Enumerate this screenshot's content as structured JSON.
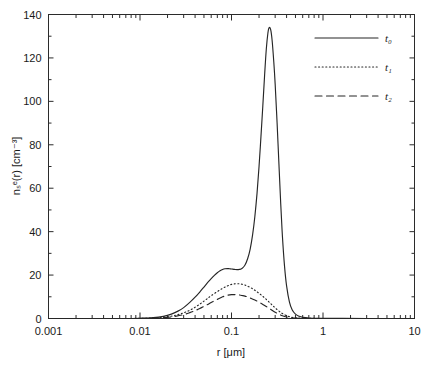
{
  "figure": {
    "background": "#ffffff",
    "line_color": "#262626"
  },
  "chart_data": {
    "type": "line",
    "title": "",
    "xlabel": "r [μm]",
    "ylabel": "nₛᵉ(r) [cm⁻³]",
    "xscale": "log",
    "yscale": "linear",
    "xlim": [
      0.001,
      10
    ],
    "ylim": [
      0,
      140
    ],
    "grid": false,
    "legend_position": "top-right",
    "xticks": [
      0.001,
      0.01,
      0.1,
      1,
      10
    ],
    "xtick_labels": [
      "0.001",
      "0.01",
      "0.1",
      "1",
      "10"
    ],
    "yticks": [
      0,
      20,
      40,
      60,
      80,
      100,
      120,
      140
    ],
    "ytick_labels": [
      "0",
      "20",
      "40",
      "60",
      "80",
      "100",
      "120",
      "140"
    ],
    "series": [
      {
        "name": "t₀",
        "style": "solid",
        "peak_value": 134,
        "peak_x": 0.25,
        "shoulder_value": 23,
        "shoulder_x": 0.085,
        "x": [
          0.001,
          0.003,
          0.006,
          0.01,
          0.014,
          0.018,
          0.022,
          0.026,
          0.03,
          0.035,
          0.04,
          0.045,
          0.05,
          0.055,
          0.06,
          0.065,
          0.07,
          0.075,
          0.08,
          0.085,
          0.09,
          0.095,
          0.1,
          0.108,
          0.115,
          0.122,
          0.13,
          0.14,
          0.15,
          0.16,
          0.17,
          0.18,
          0.19,
          0.2,
          0.21,
          0.22,
          0.23,
          0.24,
          0.25,
          0.258,
          0.268,
          0.278,
          0.29,
          0.3,
          0.315,
          0.33,
          0.345,
          0.36,
          0.38,
          0.4,
          0.43,
          0.46,
          0.5,
          0.55,
          0.6,
          0.7,
          0.9,
          1.5,
          3.0,
          10.0
        ],
        "y": [
          0.0,
          0.0,
          0.0,
          0.1,
          0.4,
          1.0,
          2.0,
          3.4,
          5.0,
          7.4,
          9.8,
          12.2,
          14.5,
          16.6,
          18.4,
          19.9,
          21.1,
          22.0,
          22.6,
          22.9,
          23.0,
          22.9,
          22.8,
          22.6,
          22.5,
          22.6,
          23.0,
          24.5,
          27.5,
          32.0,
          38.5,
          47.0,
          57.5,
          70.0,
          84.0,
          98.0,
          112.0,
          124.0,
          131.5,
          134.0,
          133.0,
          128.0,
          118.0,
          108.0,
          90.0,
          71.0,
          53.0,
          38.0,
          24.0,
          15.0,
          7.5,
          4.0,
          2.0,
          1.0,
          0.55,
          0.25,
          0.1,
          0.03,
          0.0,
          0.0
        ]
      },
      {
        "name": "t₁",
        "style": "dotted",
        "peak_value": 16,
        "peak_x": 0.11,
        "x": [
          0.001,
          0.005,
          0.01,
          0.015,
          0.02,
          0.025,
          0.03,
          0.035,
          0.04,
          0.045,
          0.05,
          0.055,
          0.06,
          0.07,
          0.08,
          0.09,
          0.1,
          0.11,
          0.12,
          0.13,
          0.14,
          0.15,
          0.165,
          0.18,
          0.2,
          0.22,
          0.24,
          0.26,
          0.28,
          0.3,
          0.33,
          0.36,
          0.4,
          0.45,
          0.5,
          0.6,
          0.8,
          1.5,
          10.0
        ],
        "y": [
          0.0,
          0.0,
          0.05,
          0.3,
          0.8,
          1.6,
          2.6,
          3.8,
          5.2,
          6.6,
          8.0,
          9.3,
          10.5,
          12.4,
          13.9,
          15.0,
          15.7,
          16.0,
          16.0,
          15.8,
          15.4,
          14.9,
          14.0,
          13.0,
          11.6,
          10.2,
          8.8,
          7.4,
          6.1,
          4.9,
          3.4,
          2.3,
          1.3,
          0.6,
          0.3,
          0.1,
          0.03,
          0.0,
          0.0
        ]
      },
      {
        "name": "t₂",
        "style": "dashed",
        "peak_value": 11,
        "peak_x": 0.105,
        "x": [
          0.001,
          0.005,
          0.01,
          0.015,
          0.02,
          0.025,
          0.03,
          0.035,
          0.04,
          0.045,
          0.05,
          0.055,
          0.06,
          0.07,
          0.08,
          0.09,
          0.1,
          0.11,
          0.12,
          0.13,
          0.14,
          0.15,
          0.165,
          0.18,
          0.2,
          0.22,
          0.24,
          0.26,
          0.28,
          0.3,
          0.33,
          0.36,
          0.4,
          0.45,
          0.5,
          0.6,
          0.8,
          1.5,
          10.0
        ],
        "y": [
          0.0,
          0.0,
          0.03,
          0.2,
          0.55,
          1.1,
          1.8,
          2.7,
          3.6,
          4.6,
          5.6,
          6.5,
          7.4,
          8.8,
          10.0,
          10.7,
          11.0,
          11.0,
          10.9,
          10.6,
          10.3,
          9.9,
          9.2,
          8.5,
          7.5,
          6.5,
          5.5,
          4.6,
          3.7,
          2.9,
          2.0,
          1.3,
          0.7,
          0.33,
          0.16,
          0.05,
          0.01,
          0.0,
          0.0
        ]
      }
    ]
  }
}
